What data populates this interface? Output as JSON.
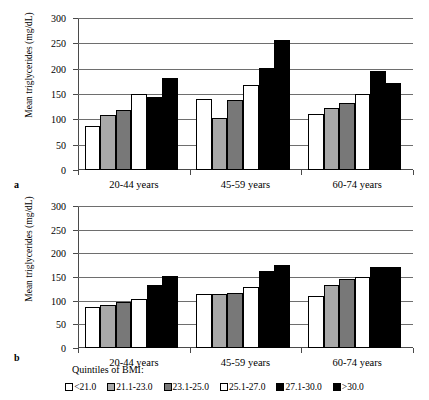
{
  "figure": {
    "panels": [
      {
        "label": "a"
      },
      {
        "label": "b"
      }
    ],
    "y_axis_title": "Mean triglycerides (mg/dL)",
    "legend_title": "Quintiles of BMI:"
  },
  "chart_data": [
    {
      "type": "bar",
      "panel": "a",
      "title": "",
      "xlabel": "",
      "ylabel": "Mean triglycerides (mg/dL)",
      "ylim": [
        0,
        300
      ],
      "yticks": [
        0,
        50,
        100,
        150,
        200,
        250,
        300
      ],
      "ytick_labels": [
        "0",
        "50",
        "100",
        "150",
        "200",
        "250",
        "300"
      ],
      "grid": true,
      "legend_position": "bottom",
      "categories": [
        "20-44 years",
        "45-59 years",
        "60-74 years"
      ],
      "series": [
        {
          "name": "<21.0",
          "color": "#ffffff",
          "values": [
            87,
            140,
            110
          ]
        },
        {
          "name": "21.1-23.0",
          "color": "#a8a8a8",
          "values": [
            108,
            103,
            122
          ]
        },
        {
          "name": "23.1-25.0",
          "color": "#787878",
          "values": [
            118,
            138,
            133
          ]
        },
        {
          "name": "25.1-27.0",
          "color": "#ffffff",
          "values": [
            150,
            168,
            150
          ]
        },
        {
          "name": "27.1-30.0",
          "color": "#000000",
          "values": [
            145,
            202,
            195
          ]
        },
        {
          "name": ">30.0",
          "color": "#000000",
          "values": [
            182,
            257,
            172
          ]
        }
      ]
    },
    {
      "type": "bar",
      "panel": "b",
      "title": "",
      "xlabel": "",
      "ylabel": "Mean triglycerides (mg/dL)",
      "ylim": [
        0,
        300
      ],
      "yticks": [
        0,
        50,
        100,
        150,
        200,
        250,
        300
      ],
      "ytick_labels": [
        "0",
        "50",
        "100",
        "150",
        "200",
        "250",
        "300"
      ],
      "grid": true,
      "legend_position": "bottom",
      "categories": [
        "20-44 years",
        "45-59 years",
        "60-74 years"
      ],
      "series": [
        {
          "name": "<21.0",
          "color": "#ffffff",
          "values": [
            87,
            114,
            110
          ]
        },
        {
          "name": "21.1-23.0",
          "color": "#a8a8a8",
          "values": [
            90,
            114,
            133
          ]
        },
        {
          "name": "23.1-25.0",
          "color": "#787878",
          "values": [
            98,
            117,
            146
          ]
        },
        {
          "name": "25.1-27.0",
          "color": "#ffffff",
          "values": [
            103,
            128,
            151
          ]
        },
        {
          "name": "27.1-30.0",
          "color": "#000000",
          "values": [
            134,
            163,
            172
          ]
        },
        {
          "name": ">30.0",
          "color": "#000000",
          "values": [
            152,
            175,
            172
          ]
        }
      ]
    }
  ],
  "legend": {
    "items": [
      {
        "label": "<21.0",
        "color": "#ffffff"
      },
      {
        "label": "21.1-23.0",
        "color": "#a8a8a8"
      },
      {
        "label": "23.1-25.0",
        "color": "#787878"
      },
      {
        "label": "25.1-27.0",
        "color": "#ffffff"
      },
      {
        "label": "27.1-30.0",
        "color": "#000000"
      },
      {
        "label": ">30.0",
        "color": "#000000"
      }
    ]
  }
}
